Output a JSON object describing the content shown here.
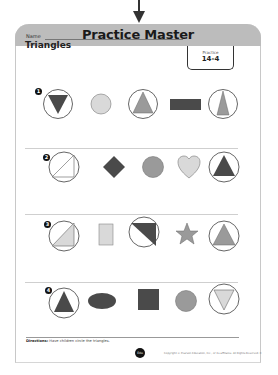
{
  "header": {
    "banner_title": "Practice Master",
    "practice_label": "Practice",
    "practice_number": "14-4"
  },
  "worksheet": {
    "name_label": "Name",
    "title": "Triangles"
  },
  "rows": [
    {
      "number": "1",
      "items": [
        {
          "shape": "triangle-down",
          "fill": "dark",
          "circled": true
        },
        {
          "shape": "circle",
          "fill": "light",
          "circled": false
        },
        {
          "shape": "triangle-up",
          "fill": "medium",
          "circled": true
        },
        {
          "shape": "rectangle",
          "fill": "dark",
          "circled": false
        },
        {
          "shape": "triangle-tall",
          "fill": "medium",
          "circled": true
        }
      ]
    },
    {
      "number": "2",
      "items": [
        {
          "shape": "right-triangle-outline",
          "fill": "none",
          "circled": true
        },
        {
          "shape": "diamond",
          "fill": "dark",
          "circled": false
        },
        {
          "shape": "circle",
          "fill": "medium",
          "circled": false
        },
        {
          "shape": "heart",
          "fill": "light",
          "circled": false
        },
        {
          "shape": "triangle-up",
          "fill": "dark",
          "circled": true
        }
      ]
    },
    {
      "number": "3",
      "items": [
        {
          "shape": "right-triangle",
          "fill": "light",
          "circled": true
        },
        {
          "shape": "rectangle-tall",
          "fill": "light",
          "circled": false
        },
        {
          "shape": "right-triangle-top",
          "fill": "dark",
          "circled": true
        },
        {
          "shape": "star",
          "fill": "medium",
          "circled": false
        },
        {
          "shape": "triangle-up",
          "fill": "medium",
          "circled": true
        }
      ]
    },
    {
      "number": "4",
      "items": [
        {
          "shape": "triangle-up",
          "fill": "dark",
          "circled": true
        },
        {
          "shape": "oval",
          "fill": "dark",
          "circled": false
        },
        {
          "shape": "square",
          "fill": "dark",
          "circled": false
        },
        {
          "shape": "circle",
          "fill": "medium",
          "circled": false
        },
        {
          "shape": "triangle-down",
          "fill": "light",
          "circled": true
        }
      ]
    }
  ],
  "footer": {
    "directions_label": "Directions:",
    "directions_text": "Have children circle the triangles.",
    "logo_text": "Edu",
    "copyright": "Copyright © Pearson Education, Inc., or its affiliates. All Rights Reserved. K"
  },
  "colors": {
    "banner": "#bcbcbc",
    "dark": "#4a4a4a",
    "medium": "#9a9a9a",
    "light": "#d9d9d9",
    "circle_stroke": "#555555"
  }
}
